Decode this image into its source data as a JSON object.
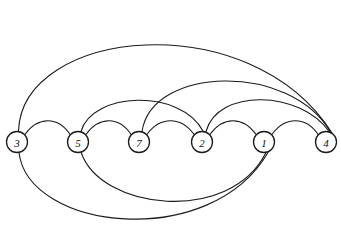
{
  "diagram": {
    "type": "arc-diagram",
    "width": 341,
    "height": 250,
    "background_color": "#ffffff",
    "stroke_color": "#1a1a1a",
    "node_fill_color": "#ffffff",
    "node_radius": 10.5,
    "baseline_y": 142,
    "nodes": [
      {
        "id": "3",
        "label": "3",
        "x": 17,
        "y": 142
      },
      {
        "id": "5",
        "label": "5",
        "x": 78,
        "y": 142
      },
      {
        "id": "7",
        "label": "7",
        "x": 139,
        "y": 142
      },
      {
        "id": "2",
        "label": "2",
        "x": 202,
        "y": 142
      },
      {
        "id": "1",
        "label": "1",
        "x": 264,
        "y": 142
      },
      {
        "id": "4",
        "label": "4",
        "x": 326,
        "y": 142
      }
    ],
    "edges": [
      {
        "id": "e-3-5",
        "from": "3",
        "to": "5",
        "side": "above",
        "apex_y": 118,
        "d": "M 24.5 135 C 38 116, 58 116, 70.5 135"
      },
      {
        "id": "e-5-7",
        "from": "5",
        "to": "7",
        "side": "above",
        "apex_y": 118,
        "d": "M 85.5 135 C 99 116, 119 116, 131.5 135"
      },
      {
        "id": "e-7-2",
        "from": "7",
        "to": "2",
        "side": "above",
        "apex_y": 118,
        "d": "M 146.5 135 C 160 116, 181 116, 194.5 135"
      },
      {
        "id": "e-2-1",
        "from": "2",
        "to": "1",
        "side": "above",
        "apex_y": 118,
        "d": "M 209.5 135 C 223 116, 243 116, 256.5 135"
      },
      {
        "id": "e-1-4",
        "from": "1",
        "to": "4",
        "side": "above",
        "apex_y": 118,
        "d": "M 271.5 135 C 285 116, 306 116, 318.5 135"
      },
      {
        "id": "e-5-2",
        "from": "5",
        "to": "2",
        "side": "above",
        "apex_y": 98,
        "d": "M 81 131.5 C 92 92, 180 88, 203 131"
      },
      {
        "id": "e-2-4",
        "from": "2",
        "to": "4",
        "side": "above",
        "apex_y": 95,
        "d": "M 206 131.5 C 218 88, 300 90, 329.5 132"
      },
      {
        "id": "e-7-4",
        "from": "7",
        "to": "4",
        "side": "above",
        "apex_y": 72,
        "d": "M 142 131.5 C 152 66, 290 62, 330.5 132"
      },
      {
        "id": "e-3-4",
        "from": "3",
        "to": "4",
        "side": "above",
        "apex_y": 12,
        "d": "M 18.5 131 C 22 28, 250 4, 332 133"
      },
      {
        "id": "e-5-1",
        "from": "5",
        "to": "1",
        "side": "below",
        "apex_y": 218,
        "d": "M 81 152 C 100 210, 230 225, 266 152.5"
      },
      {
        "id": "e-3-1",
        "from": "3",
        "to": "1",
        "side": "below",
        "apex_y": 240,
        "d": "M 19 152.5 C 28 230, 210 252, 268 152.5"
      }
    ]
  }
}
